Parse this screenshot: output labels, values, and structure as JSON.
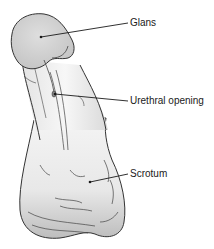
{
  "diagram": {
    "labels": [
      {
        "id": "glans",
        "text": "Glans"
      },
      {
        "id": "urethral_opening",
        "text": "Urethral opening"
      },
      {
        "id": "scrotum",
        "text": "Scrotum"
      }
    ],
    "colors": {
      "outline": "#333333",
      "skin_light": "#f0f0f0",
      "skin_mid": "#d6d6d6",
      "skin_shadow": "#b8b8b8",
      "leader_line": "#1a1a1a",
      "background": "#ffffff"
    }
  }
}
